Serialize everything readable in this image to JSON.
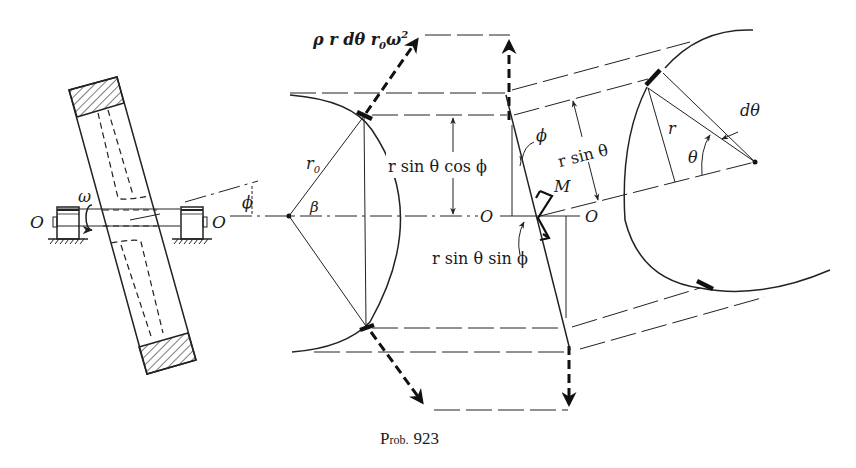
{
  "figure": {
    "caption": "Prob. 923",
    "caption_prefix": "P",
    "caption_smallcaps": "rob.",
    "caption_number": "923"
  },
  "labels": {
    "omega": "ω",
    "phi_left": "ϕ",
    "O_left_bearing": "O",
    "O_right_bearing": "O",
    "force": "ρ r dθ r",
    "force_sub": "0",
    "force_tail": "ω",
    "force_sup": "2",
    "r0": "r",
    "r0_sub": "0",
    "beta": "β",
    "r_sin_theta_cos_phi": "r sin θ cos ϕ",
    "phi_center": "ϕ",
    "O_center_left": "O",
    "O_center_right": "O",
    "M": "M",
    "r_sin_theta_sin_phi": "r sin θ sin ϕ",
    "r_sin_theta": "r sin θ",
    "r": "r",
    "d_theta": "dθ",
    "theta": "θ"
  },
  "colors": {
    "ink": "#111111",
    "paper": "#ffffff"
  }
}
